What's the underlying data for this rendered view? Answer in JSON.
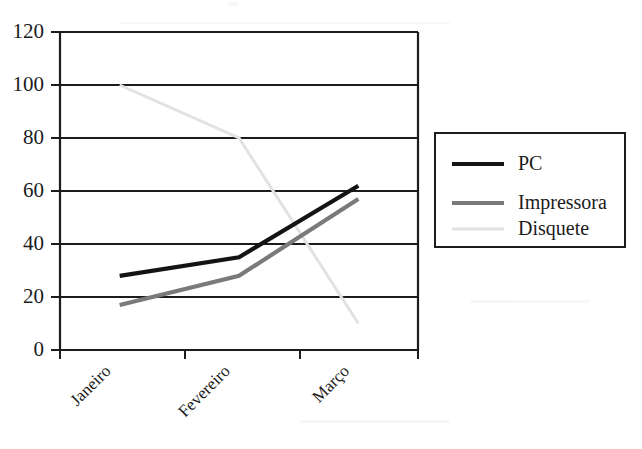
{
  "chart_data": {
    "type": "line",
    "title": "",
    "subtitle": "",
    "xlabel": "",
    "ylabel": "",
    "categories": [
      "Janeiro",
      "Fevereiro",
      "Março"
    ],
    "ylim": [
      0,
      120
    ],
    "yticks": [
      0,
      20,
      40,
      60,
      80,
      100,
      120
    ],
    "grid": "horizontal",
    "legend_position": "right",
    "series": [
      {
        "name": "PC",
        "values": [
          28,
          35,
          62
        ],
        "color": "#141414",
        "width": 4.2
      },
      {
        "name": "Impressora",
        "values": [
          17,
          28,
          57
        ],
        "color": "#7a7a7a",
        "width": 4.2
      },
      {
        "name": "Disquete",
        "values": [
          100,
          80,
          10
        ],
        "color": "#e2e2e2",
        "width": 3.0
      }
    ]
  },
  "axes": {
    "y_tick_labels": [
      "120",
      "100",
      "80",
      "60",
      "40",
      "20",
      "0"
    ],
    "x_tick_labels": [
      "Janeiro",
      "Fevereiro",
      "Março"
    ]
  },
  "legend": {
    "entries": [
      {
        "label": "PC"
      },
      {
        "label": "Impressora"
      },
      {
        "label": "Disquete"
      }
    ]
  },
  "colors": {
    "axis": "#1c1c1c",
    "grid": "#1c1c1c",
    "background": "#ffffff",
    "series_pc": "#141414",
    "series_impressora": "#7a7a7a",
    "series_disquete": "#e2e2e2"
  }
}
